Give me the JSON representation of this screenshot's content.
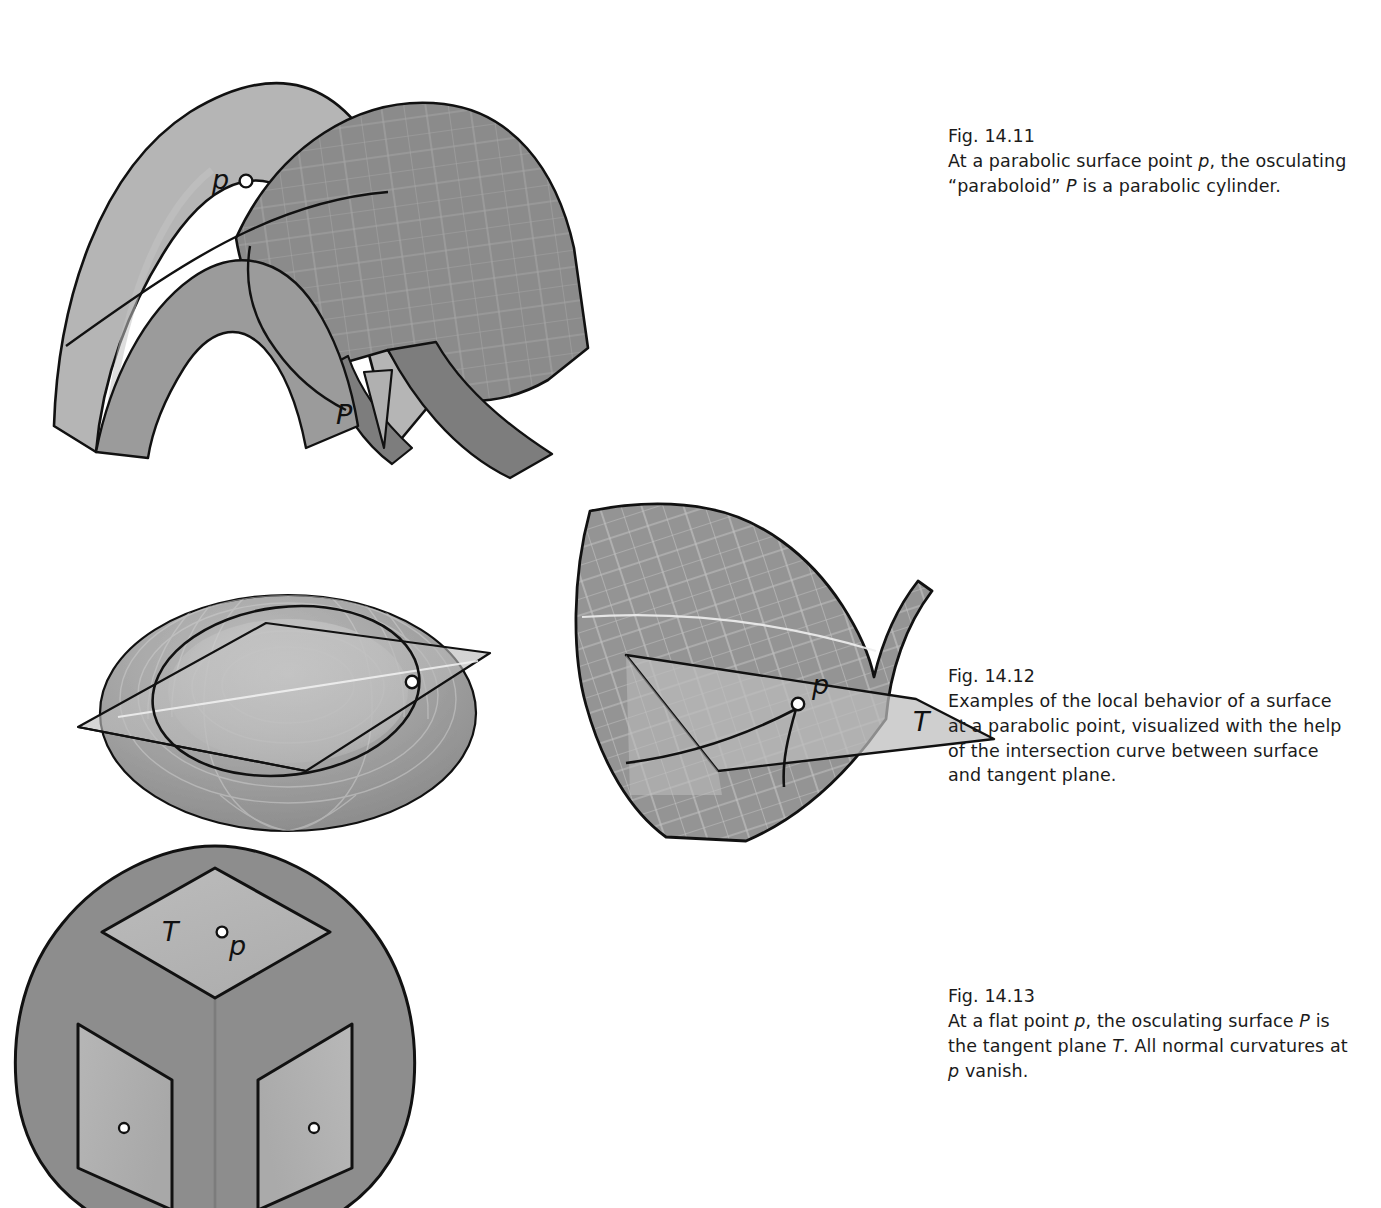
{
  "page": {
    "background": "#ffffff",
    "width": 1381,
    "height": 1205
  },
  "palette": {
    "surface_light": "#b3b3b3",
    "surface_mid": "#a0a0a0",
    "surface_dark": "#8b8b8b",
    "surface_darker": "#7d7d7d",
    "plane_light": "#bdbdbd",
    "outline": "#111111",
    "grid_line": "#cfcfcf",
    "marker_fill": "#ffffff",
    "marker_stroke": "#111111",
    "caption_text": "#1b1b1b"
  },
  "figures": [
    {
      "id": "fig-14-11",
      "caption": {
        "number": "Fig. 14.11",
        "text": "At a parabolic surface point p, the osculating “paraboloid” P is a parabolic cylinder."
      },
      "labels": [
        {
          "name": "point-p",
          "text": "p",
          "style": "italic"
        },
        {
          "name": "surface-P",
          "text": "P",
          "style": "italic"
        }
      ],
      "markers": [
        {
          "name": "point-p-marker",
          "shape": "circle",
          "fill": "#ffffff",
          "stroke": "#111111"
        }
      ],
      "description": "Two intersecting curved surfaces: a light parabolic cylinder and a darker gridded surface, meeting along a curve through point p."
    },
    {
      "id": "fig-14-12",
      "caption": {
        "number": "Fig. 14.12",
        "text": "Examples of the local behavior of a surface at a parabolic point, visualized with the help of the intersection curve between surface and tangent plane."
      },
      "labels": [
        {
          "name": "point-p",
          "text": "p",
          "style": "italic"
        },
        {
          "name": "tangent-plane-T",
          "text": "T",
          "style": "italic"
        }
      ],
      "markers": [
        {
          "name": "torus-point-marker",
          "shape": "circle",
          "fill": "#ffffff",
          "stroke": "#111111"
        },
        {
          "name": "saddle-point-p-marker",
          "shape": "circle",
          "fill": "#ffffff",
          "stroke": "#111111"
        }
      ],
      "description": "Left: a torus cut by its tangent plane, intersection curve is a circle. Right: a saddle-like surface cut by tangent plane T through parabolic point p."
    },
    {
      "id": "fig-14-13",
      "caption": {
        "number": "Fig. 14.13",
        "text": "At a flat point p, the osculating surface P is the tangent plane T. All normal curvatures at p vanish."
      },
      "labels": [
        {
          "name": "tangent-plane-T",
          "text": "T",
          "style": "italic"
        },
        {
          "name": "point-p",
          "text": "p",
          "style": "italic"
        }
      ],
      "markers": [
        {
          "name": "top-face-flat-point-marker",
          "shape": "circle",
          "fill": "#ffffff",
          "stroke": "#111111"
        },
        {
          "name": "left-face-flat-point-marker",
          "shape": "circle",
          "fill": "#ffffff",
          "stroke": "#111111"
        },
        {
          "name": "right-face-flat-point-marker",
          "shape": "circle",
          "fill": "#ffffff",
          "stroke": "#111111"
        }
      ],
      "description": "A rounded cube seen from a corner; the three visible flat faces each carry a flat point marker, the top face is labeled tangent plane T with flat point p."
    }
  ]
}
